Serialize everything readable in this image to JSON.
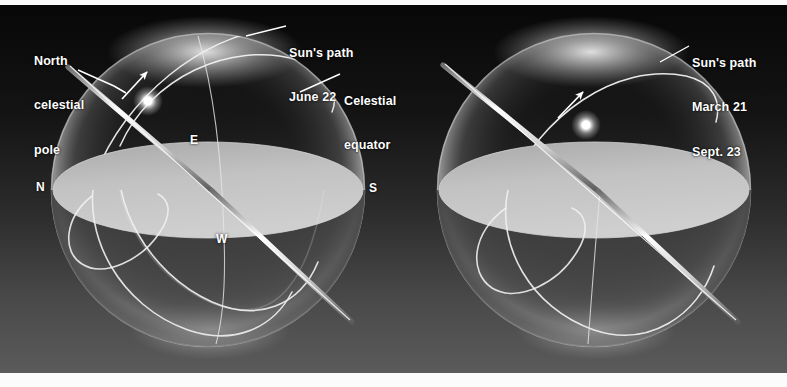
{
  "figure": {
    "background_top_color": "#0a0a0a",
    "background_bottom_color": "#5c5c5c",
    "line_color": "#f2f2f2",
    "horizon_fill_color": "#b9b9b9",
    "sphere_glow_color": "#d8d8d8",
    "bottom_strip_color": "#f7f7f7"
  },
  "panels": [
    {
      "id": "left-panel",
      "name": "summer-solstice-sphere",
      "center_x": 208,
      "center_y": 190,
      "radius": 157,
      "labels": [
        {
          "name": "north-celestial-pole-label",
          "lines": [
            "North",
            "celestial",
            "pole"
          ],
          "x": 34,
          "y": 24
        },
        {
          "name": "suns-path-june-label",
          "lines": [
            "Sun's path",
            "June 22"
          ],
          "x": 289,
          "y": 16
        },
        {
          "name": "celestial-equator-label",
          "lines": [
            "Celestial",
            "equator"
          ],
          "x": 344,
          "y": 64
        }
      ],
      "compass": [
        {
          "name": "compass-north",
          "text": "N",
          "x": 36,
          "y": 180
        },
        {
          "name": "compass-south",
          "text": "S",
          "x": 369,
          "y": 181
        },
        {
          "name": "compass-east",
          "text": "E",
          "x": 190,
          "y": 133
        },
        {
          "name": "compass-west",
          "text": "W",
          "x": 216,
          "y": 232
        }
      ],
      "sun": {
        "name": "sun-glow",
        "x": 148,
        "y": 101,
        "radius": 9
      },
      "motion_arrow": {
        "name": "diurnal-motion-arrow",
        "x1": 122,
        "y1": 99,
        "x2": 147,
        "y2": 72
      }
    },
    {
      "id": "right-panel",
      "name": "equinox-sphere",
      "center_x": 594,
      "center_y": 190,
      "radius": 157,
      "labels": [
        {
          "name": "suns-path-equinox-label",
          "lines": [
            "Sun's path",
            "March 21",
            "Sept. 23"
          ],
          "x": 692,
          "y": 26
        }
      ],
      "compass": [],
      "sun": {
        "name": "sun-glow",
        "x": 586,
        "y": 125,
        "radius": 9
      },
      "motion_arrow": {
        "name": "diurnal-motion-arrow",
        "x1": 558,
        "y1": 118,
        "x2": 583,
        "y2": 92
      }
    }
  ],
  "leader_lines": [
    {
      "name": "leader-north-celestial-pole",
      "points": "78,70 114,86 126,93"
    },
    {
      "name": "leader-suns-path-june",
      "points": "286,26 246,36"
    },
    {
      "name": "leader-celestial-equator",
      "points": "340,74 300,92"
    },
    {
      "name": "leader-suns-path-equinox",
      "points": "689,46 660,62"
    }
  ]
}
